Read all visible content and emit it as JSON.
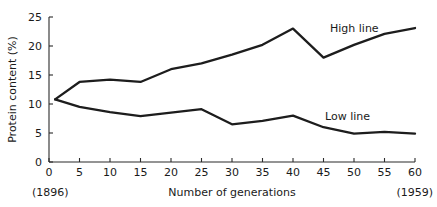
{
  "chart_data": {
    "type": "line",
    "title": "",
    "xlabel": "Number of generations",
    "ylabel": "Protein content (%)",
    "xlim": [
      0,
      60
    ],
    "ylim": [
      0,
      25
    ],
    "grid": false,
    "legend_position": "inline-right",
    "x_ticks": [
      "0",
      "5",
      "10",
      "15",
      "20",
      "25",
      "30",
      "35",
      "40",
      "45",
      "50",
      "55",
      "60"
    ],
    "x_tick_values": [
      0,
      5,
      10,
      15,
      20,
      25,
      30,
      35,
      40,
      45,
      50,
      55,
      60
    ],
    "y_ticks": [
      "0",
      "5",
      "10",
      "15",
      "20",
      "25"
    ],
    "y_tick_values": [
      0,
      5,
      10,
      15,
      20,
      25
    ],
    "annotations": [
      {
        "text": "(1896)",
        "position": "below-axis-left",
        "x": 0
      },
      {
        "text": "(1959)",
        "position": "below-axis-right",
        "x": 60
      }
    ],
    "x": [
      1,
      5,
      10,
      15,
      20,
      25,
      30,
      35,
      40,
      45,
      50,
      55,
      60
    ],
    "series": [
      {
        "name": "High line",
        "label": "High line",
        "color": "#1d1d1d",
        "values": [
          10.8,
          13.8,
          14.2,
          13.8,
          16.0,
          17.0,
          18.5,
          20.2,
          23.0,
          18.0,
          20.2,
          22.1,
          23.1
        ]
      },
      {
        "name": "Low line",
        "label": "Low line",
        "color": "#1d1d1d",
        "values": [
          10.8,
          9.5,
          8.6,
          7.9,
          8.5,
          9.1,
          6.5,
          7.1,
          8.0,
          6.0,
          4.9,
          5.2,
          4.9
        ]
      }
    ]
  },
  "geometry": {
    "plot_left": 49,
    "plot_right": 415,
    "plot_top": 17,
    "plot_bottom": 162
  },
  "series_label_positions": [
    {
      "x": 330,
      "y": 32
    },
    {
      "x": 325,
      "y": 120
    }
  ]
}
